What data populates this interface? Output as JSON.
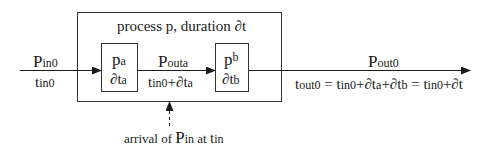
{
  "diagram": {
    "outer_box": {
      "title": "process p, duration ∂t"
    },
    "input": {
      "packet": "P",
      "packet_sub": "in0",
      "time": "t",
      "time_sub": "in0"
    },
    "sub_process_a": {
      "name": "p",
      "name_sub": "a",
      "duration": "∂t",
      "duration_sub": "a"
    },
    "intermediate": {
      "packet": "P",
      "packet_sub": "outa",
      "time_pre": "t",
      "time_pre_sub": "in0",
      "time_mid": "+∂t",
      "time_mid_sub": "a"
    },
    "sub_process_b": {
      "name": "p",
      "name_sub": "b",
      "duration": "∂t",
      "duration_sub": "b"
    },
    "output": {
      "packet": "P",
      "packet_sub": "out0",
      "eq": [
        {
          "t": "t",
          "s": "out0"
        },
        {
          "t": " = t",
          "s": "in0"
        },
        {
          "t": "+∂t",
          "s": "a"
        },
        {
          "t": "+∂t",
          "s": "b"
        },
        {
          "t": " = t",
          "s": "in0"
        },
        {
          "t": "+∂t",
          "s": ""
        }
      ]
    },
    "arrival": {
      "pre": "arrival of ",
      "packet": "P",
      "packet_sub": "in",
      "mid": " at ",
      "time": "t",
      "time_sub": "in"
    }
  }
}
